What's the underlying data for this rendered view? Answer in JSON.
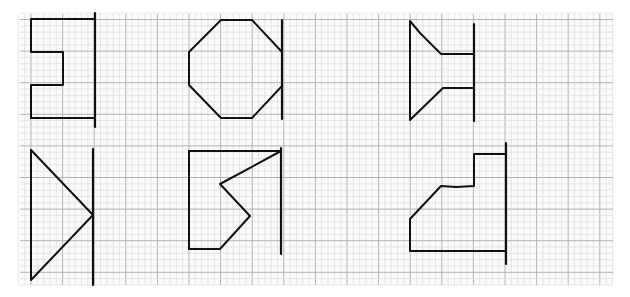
{
  "figure": {
    "paper": {
      "x": 20,
      "y": 14,
      "width": 593,
      "height": 271,
      "background": "#fbfbfb",
      "minor_color": "#d9d9d9",
      "major_color": "#b3b3b3",
      "major_spacing": 31.6,
      "minor_per_major": 5,
      "origin_x": 31,
      "origin_y": 19.5
    },
    "ink_color": "#111111",
    "shapes": [
      {
        "id": "shape-1-bracket",
        "name": "E-shaped bracket",
        "polyline": [
          [
            95,
            19
          ],
          [
            31,
            19
          ],
          [
            31,
            52
          ],
          [
            63,
            52
          ],
          [
            63,
            85
          ],
          [
            31,
            85
          ],
          [
            31,
            118
          ],
          [
            95,
            118
          ]
        ],
        "mirror_line": [
          [
            95,
            13
          ],
          [
            95,
            127
          ]
        ]
      },
      {
        "id": "shape-2-octagon",
        "name": "Octagon",
        "polyline": [
          [
            221,
            20
          ],
          [
            252,
            20
          ],
          [
            282,
            52
          ],
          [
            282,
            86
          ],
          [
            252,
            118
          ],
          [
            221,
            118
          ],
          [
            189,
            85
          ],
          [
            189,
            52
          ],
          [
            221,
            20
          ]
        ],
        "mirror_line": [
          [
            282,
            20
          ],
          [
            282,
            119
          ]
        ]
      },
      {
        "id": "shape-3-funnel",
        "name": "Funnel shape",
        "polyline": [
          [
            474,
            54
          ],
          [
            441,
            54
          ],
          [
            420,
            33
          ],
          [
            410,
            21
          ],
          [
            410,
            120
          ],
          [
            443,
            88
          ],
          [
            474,
            88
          ]
        ],
        "mirror_line": [
          [
            474,
            24
          ],
          [
            474,
            121
          ]
        ]
      },
      {
        "id": "shape-4-triangle",
        "name": "Triangle",
        "polyline": [
          [
            31,
            150
          ],
          [
            93,
            215
          ],
          [
            31,
            280
          ],
          [
            31,
            150
          ]
        ],
        "mirror_line": [
          [
            93,
            149
          ],
          [
            93,
            285
          ]
        ]
      },
      {
        "id": "shape-5-zigzag",
        "name": "Zig-zag polygon",
        "polyline": [
          [
            281,
            151
          ],
          [
            189,
            151
          ],
          [
            189,
            249
          ],
          [
            220,
            249
          ],
          [
            250,
            216
          ],
          [
            220,
            184
          ],
          [
            281,
            151
          ]
        ],
        "mirror_line": [
          [
            281,
            148
          ],
          [
            281,
            254
          ]
        ]
      },
      {
        "id": "shape-6-step",
        "name": "Stepped polygon",
        "polyline": [
          [
            506,
            154
          ],
          [
            474,
            154
          ],
          [
            474,
            186
          ],
          [
            456,
            187
          ],
          [
            441,
            186
          ],
          [
            410,
            219
          ],
          [
            410,
            251
          ],
          [
            506,
            251
          ]
        ],
        "mirror_line": [
          [
            506,
            143
          ],
          [
            506,
            264
          ]
        ]
      }
    ]
  }
}
